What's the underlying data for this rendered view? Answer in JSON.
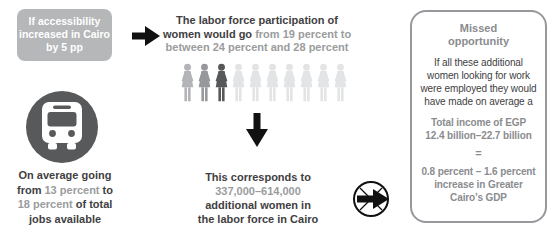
{
  "colors": {
    "condition_box_bg": "#b5b7b9",
    "condition_box_text": "#ffffff",
    "dark_text": "#414042",
    "accent_gray_text": "#9a9c9e",
    "panel_gray_text": "#8a8c8f",
    "panel_border": "#97989b",
    "bus_circle_bg": "#58595b",
    "arrow_black": "#111111"
  },
  "icons": {
    "arrow_right": "arrow-right-icon",
    "arrow_down": "arrow-down-icon",
    "bus": "bus-icon",
    "next": "next-circle-arrow-icon",
    "woman": "woman-figure-icon"
  },
  "left": {
    "condition_lines": [
      "If accessibility",
      "increased in Cairo",
      "by 5 pp"
    ],
    "caption": [
      {
        "pre": "On average going"
      },
      {
        "pre": "from ",
        "accent": "13 percent",
        "post": " to"
      },
      {
        "accent": "18 percent",
        "post": " of total"
      },
      {
        "pre": "jobs available"
      }
    ]
  },
  "middle": {
    "heading": [
      {
        "pre": "The labor force participation of"
      },
      {
        "pre": "women would go ",
        "accent": "from 19 percent to"
      },
      {
        "accent": "between 24 percent and 28 percent"
      }
    ],
    "figures": {
      "count": 10,
      "colors": [
        "#b2b4b7",
        "#96989b",
        "#57585a",
        "#e3e4e5",
        "#e3e4e5",
        "#e3e4e5",
        "#e3e4e5",
        "#e3e4e5",
        "#e3e4e5",
        "#e3e4e5"
      ]
    },
    "caption": [
      {
        "pre": "This corresponds to"
      },
      {
        "accent": "337,000–614,000"
      },
      {
        "pre": "additional women in"
      },
      {
        "pre": "the labor force in Cairo"
      }
    ]
  },
  "panel": {
    "title_lines": [
      "Missed",
      "opportunity"
    ],
    "body_lines": [
      "If all these additional",
      "women looking for work",
      "were employed they would",
      "have made on average a"
    ],
    "total_lines": [
      "Total income of EGP",
      "12.4 billion–22.7 billion"
    ],
    "equals": "=",
    "gdp_lines": [
      "0.8 percent – 1.6 percent",
      "increase in Greater",
      "Cairo’s GDP"
    ]
  }
}
